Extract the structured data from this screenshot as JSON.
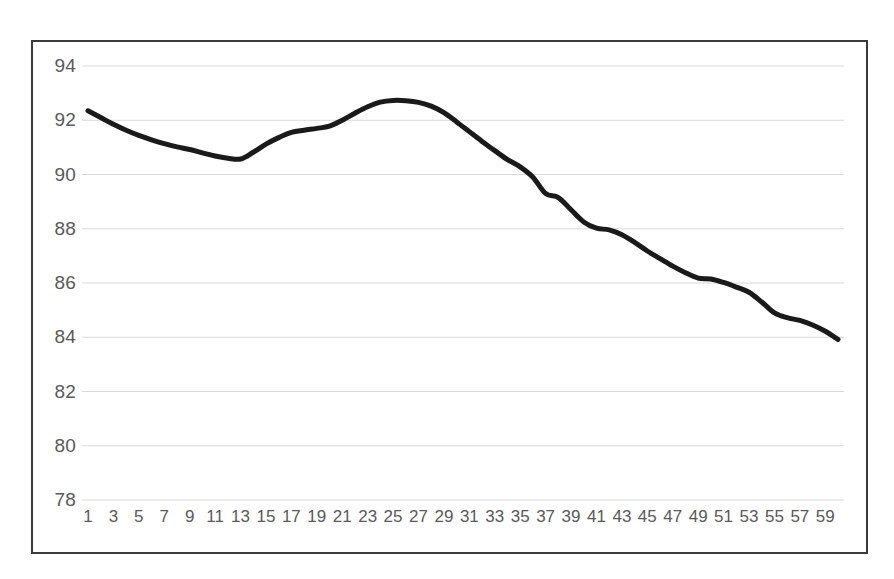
{
  "figure": {
    "background_color": "#ffffff",
    "frame_color": "#3a3a3a",
    "gridline_color": "#d9d9d9",
    "tick_label_color": "#595959"
  },
  "chart_data": {
    "type": "line",
    "title": "",
    "subtitle": "",
    "xlabel": "",
    "ylabel": "",
    "xlim": [
      1,
      60
    ],
    "ylim": [
      78,
      94
    ],
    "grid": "horizontal",
    "legend": "none",
    "line_color": "#1a1a1a",
    "line_width": 5,
    "x_tick_labels": [
      "1",
      "3",
      "5",
      "7",
      "9",
      "11",
      "13",
      "15",
      "17",
      "19",
      "21",
      "23",
      "25",
      "27",
      "29",
      "31",
      "33",
      "35",
      "37",
      "39",
      "41",
      "43",
      "45",
      "47",
      "49",
      "51",
      "53",
      "55",
      "57",
      "59"
    ],
    "y_tick_labels": [
      "78",
      "80",
      "82",
      "84",
      "86",
      "88",
      "90",
      "92",
      "94"
    ],
    "y_ticks": [
      78,
      80,
      82,
      84,
      86,
      88,
      90,
      92,
      94
    ],
    "x": [
      1,
      2,
      3,
      4,
      5,
      6,
      7,
      8,
      9,
      10,
      11,
      12,
      13,
      14,
      15,
      16,
      17,
      18,
      19,
      20,
      21,
      22,
      23,
      24,
      25,
      26,
      27,
      28,
      29,
      30,
      31,
      32,
      33,
      34,
      35,
      36,
      37,
      38,
      39,
      40,
      41,
      42,
      43,
      44,
      45,
      46,
      47,
      48,
      49,
      50,
      51,
      52,
      53,
      54,
      55,
      56,
      57,
      58,
      59,
      60
    ],
    "series": [
      {
        "name": "series-1",
        "values": [
          92.35,
          92.1,
          91.85,
          91.63,
          91.44,
          91.28,
          91.14,
          91.02,
          90.92,
          90.8,
          90.68,
          90.6,
          90.57,
          90.82,
          91.12,
          91.36,
          91.55,
          91.63,
          91.7,
          91.78,
          92.0,
          92.26,
          92.5,
          92.67,
          92.73,
          92.72,
          92.66,
          92.52,
          92.28,
          91.94,
          91.58,
          91.22,
          90.88,
          90.55,
          90.28,
          89.9,
          89.3,
          89.15,
          88.7,
          88.25,
          88.02,
          87.96,
          87.78,
          87.5,
          87.18,
          86.9,
          86.62,
          86.38,
          86.18,
          86.15,
          86.02,
          85.85,
          85.66,
          85.3,
          84.9,
          84.72,
          84.62,
          84.45,
          84.22,
          83.92
        ]
      }
    ]
  }
}
